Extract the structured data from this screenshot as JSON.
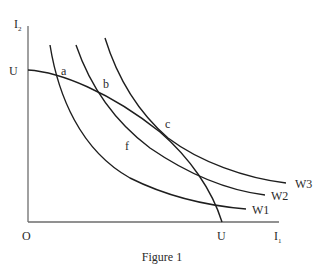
{
  "figure": {
    "caption": "Figure 1",
    "axes": {
      "y_label": "I",
      "y_label_sub": "2",
      "x_label": "I",
      "x_label_sub": "1",
      "origin_label": "O",
      "y_intercept_label": "U",
      "x_intercept_label": "U"
    },
    "curves": [
      {
        "name": "utility-possibility-frontier",
        "label": "U–U"
      },
      {
        "name": "W1",
        "label": "W1"
      },
      {
        "name": "W2",
        "label": "W2"
      },
      {
        "name": "W3",
        "label": "W3"
      }
    ],
    "points": {
      "a": "a",
      "b": "b",
      "c": "c",
      "f": "f"
    }
  }
}
